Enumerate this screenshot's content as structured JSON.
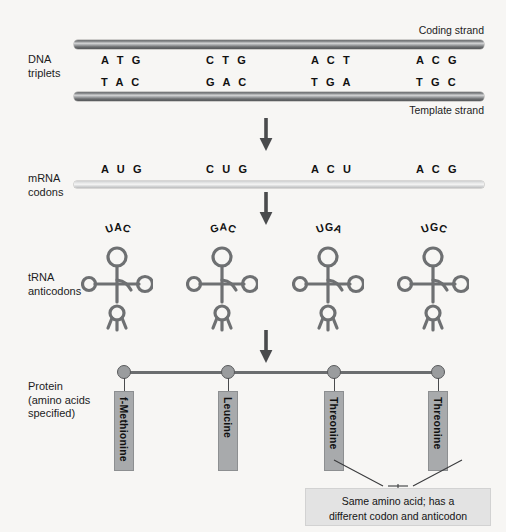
{
  "rows": {
    "dna_label": "DNA\ntriplets",
    "mrna_label": "mRNA\ncodons",
    "trna_label": "tRNA\nanticodons",
    "protein_label": "Protein\n(amino acids\nspecified)"
  },
  "dna": {
    "coding_strand_label": "Coding strand",
    "template_strand_label": "Template strand",
    "coding_triplets": [
      "A T G",
      "C T G",
      "A C T",
      "A C G"
    ],
    "template_triplets": [
      "T A C",
      "G A C",
      "T G A",
      "T G C"
    ]
  },
  "mrna": {
    "codons": [
      "A U G",
      "C U G",
      "A C U",
      "A C G"
    ]
  },
  "trna": {
    "anticodons": [
      "UAC",
      "GAC",
      "UGA",
      "UGC"
    ]
  },
  "protein": {
    "amino_acids": [
      "f-Methionine",
      "Leucine",
      "Threonine",
      "Threonine"
    ]
  },
  "annotation": {
    "line1": "Same amino acid; has a",
    "line2": "different codon and anticodon"
  },
  "colors": {
    "background": "#f7f6f4",
    "dna_bar": "#6d6f71",
    "mrna_bar": "#d8d9da",
    "amino_acid_box": "#a8aaac",
    "node": "#9a9c9e",
    "callout_background": "#e3e3e3",
    "text": "#1a1a1a"
  }
}
